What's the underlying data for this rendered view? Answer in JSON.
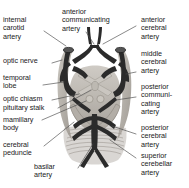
{
  "figure": {
    "view": "inferior / basal view of the brain",
    "line_color": "#4a4a4a",
    "text_color": "#1a1a1a",
    "background": "#ffffff",
    "artery_dark_color": "#2b2b2b",
    "artery_mid_color": "#6e6e6e",
    "tissue_light_color": "#b8b4ae",
    "tissue_shade_color": "#8e8a84"
  },
  "labels": {
    "internal_carotid_artery": "internal\ncarotid\nartery",
    "optic_nerve": "optic nerve",
    "temporal_lobe": "temporal\nlobe",
    "optic_chiasm": "optic chiasm",
    "pituitary_stalk": "pituitary stalk",
    "mamillary_body": "mamillary\nbody",
    "cerebral_peduncle": "cerebral\npeduncle",
    "basilar_artery": "basilar\nartery",
    "anterior_communicating_artery": "anterior\ncommunicating\nartery",
    "anterior_cerebral_artery": "anterior\ncerebral\nartery",
    "middle_cerebral_artery": "middle\ncerebral\nartery",
    "posterior_communicating_artery": "posterior\ncommuni-\ncating\nartery",
    "posterior_cerebral_artery": "posterior\ncerebral\nartery",
    "superior_cerebellar_artery": "superior\ncerebellar\nartery"
  }
}
